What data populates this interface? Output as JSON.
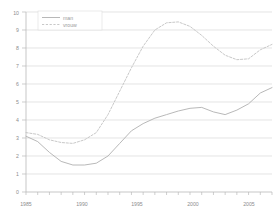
{
  "chart_data": {
    "type": "line",
    "title": "",
    "subtitle": "",
    "xlabel": "",
    "ylabel": "",
    "xlim": [
      1985,
      2006
    ],
    "ylim": [
      0,
      10
    ],
    "grid": true,
    "legend_position": "top-left",
    "x": [
      1985,
      1986,
      1987,
      1988,
      1989,
      1990,
      1991,
      1992,
      1993,
      1994,
      1995,
      1996,
      1997,
      1998,
      1999,
      2000,
      2001,
      2002,
      2003,
      2004,
      2005,
      2006
    ],
    "xticks": [
      1985,
      1990,
      1995,
      2000,
      2005
    ],
    "xtick_labels": [
      "1985",
      "1990",
      "1995",
      "2000",
      "2005"
    ],
    "yticks": [
      0,
      1,
      2,
      3,
      4,
      5,
      6,
      7,
      8,
      9,
      10
    ],
    "ytick_labels": [
      "0",
      "1",
      "2",
      "3",
      "4",
      "5",
      "6",
      "7",
      "8",
      "9",
      "10"
    ],
    "series": [
      {
        "name": "man",
        "style": "solid",
        "color": "#b0b0b0",
        "values": [
          3.1,
          2.8,
          2.2,
          1.7,
          1.5,
          1.5,
          1.6,
          2.0,
          2.7,
          3.4,
          3.8,
          4.1,
          4.3,
          4.5,
          4.65,
          4.7,
          4.45,
          4.3,
          4.55,
          4.9,
          5.5,
          5.8
        ]
      },
      {
        "name": "vrouw",
        "style": "dashed",
        "color": "#c2c2c2",
        "values": [
          3.3,
          3.2,
          2.9,
          2.75,
          2.7,
          2.9,
          3.3,
          4.3,
          5.6,
          6.9,
          8.1,
          9.0,
          9.4,
          9.45,
          9.2,
          8.7,
          8.1,
          7.6,
          7.35,
          7.4,
          7.9,
          8.2
        ]
      }
    ]
  },
  "legend": {
    "items": [
      {
        "label": "man"
      },
      {
        "label": "vrouw"
      }
    ]
  }
}
